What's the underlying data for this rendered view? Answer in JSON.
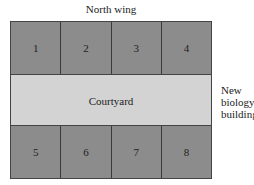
{
  "diagram": {
    "title": "North wing",
    "top_rooms": [
      "1",
      "2",
      "3",
      "4"
    ],
    "courtyard": "Courtyard",
    "bottom_rooms": [
      "5",
      "6",
      "7",
      "8"
    ],
    "side_label": [
      "New",
      "biology",
      "building"
    ],
    "colors": {
      "room": "#8c8c8c",
      "courtyard": "#d3d3d3",
      "border": "#444444"
    }
  }
}
